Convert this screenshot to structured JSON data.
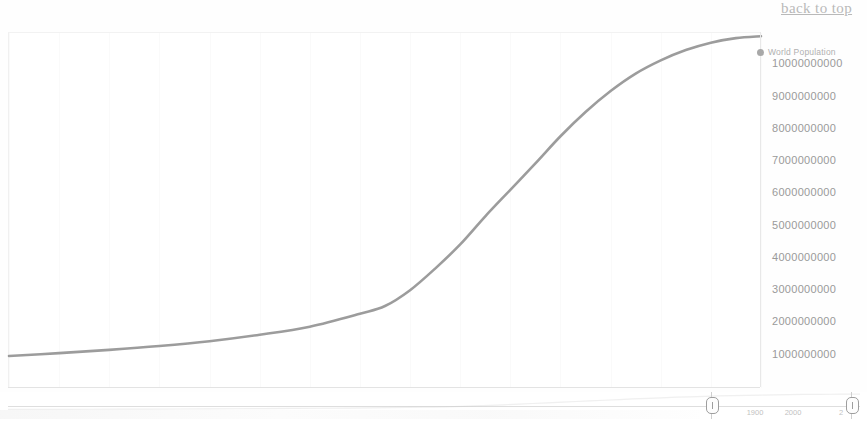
{
  "page": {
    "back_to_top_label": "back to top"
  },
  "chart": {
    "legend": {
      "marker_icon": "circle-marker-icon",
      "label": "World Population"
    }
  },
  "navigator": {
    "left_handle_icon": "navigator-handle-icon",
    "right_handle_icon": "navigator-handle-icon",
    "labels": [
      {
        "text": "1900",
        "x": 755
      },
      {
        "text": "2000",
        "x": 793
      },
      {
        "text": "2",
        "x": 841
      }
    ]
  },
  "chart_data": {
    "type": "line",
    "title": "",
    "subtitle": "",
    "xlabel": "",
    "ylabel": "",
    "grid": true,
    "legend_position": "top-right",
    "xlim": [
      1800,
      2100
    ],
    "ylim": [
      0,
      11000000000
    ],
    "xticks": [
      "1800",
      "1820",
      "1840",
      "1860",
      "1880",
      "1900",
      "1920",
      "1940",
      "1960",
      "1980",
      "2000",
      "2020",
      "2040",
      "2060",
      "2080",
      "2100"
    ],
    "yticks": [
      "1000000000",
      "2000000000",
      "3000000000",
      "4000000000",
      "5000000000",
      "6000000000",
      "7000000000",
      "8000000000",
      "9000000000",
      "10000000000"
    ],
    "ytick_values": [
      1000000000,
      2000000000,
      3000000000,
      4000000000,
      5000000000,
      6000000000,
      7000000000,
      8000000000,
      9000000000,
      10000000000
    ],
    "series": [
      {
        "name": "World Population",
        "color": "#8b8b8b",
        "x": [
          1800,
          1820,
          1840,
          1860,
          1880,
          1900,
          1920,
          1940,
          1950,
          1960,
          1970,
          1980,
          1990,
          2000,
          2010,
          2020,
          2030,
          2040,
          2050,
          2060,
          2070,
          2080,
          2090,
          2100
        ],
        "values": [
          990000000,
          1080000000,
          1180000000,
          1300000000,
          1450000000,
          1650000000,
          1900000000,
          2300000000,
          2540000000,
          3030000000,
          3700000000,
          4450000000,
          5320000000,
          6140000000,
          6960000000,
          7800000000,
          8550000000,
          9200000000,
          9740000000,
          10150000000,
          10470000000,
          10700000000,
          10840000000,
          10900000000
        ]
      }
    ]
  }
}
